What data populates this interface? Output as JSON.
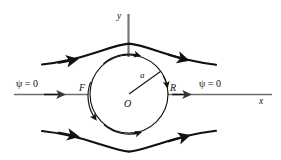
{
  "figure": {
    "labels": {
      "psi_left": "ψ = 0",
      "psi_right": "ψ = 0",
      "axis_x": "x",
      "axis_y": "y",
      "point_front": "F",
      "point_rear": "R",
      "center": "O",
      "radius": "a"
    },
    "colors": {
      "stroke": "#111111",
      "axis": "#6f6f6f",
      "background": "#ffffff"
    },
    "geometry": {
      "circle_center_x": 129,
      "circle_center_y": 94,
      "circle_radius": 39,
      "x_axis_y": 94,
      "y_axis_x": 128.5
    }
  }
}
